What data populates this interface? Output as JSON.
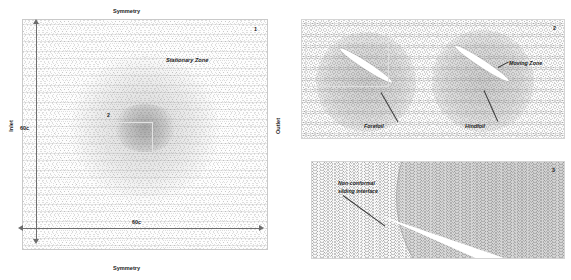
{
  "figure": {
    "type": "cfd-mesh-domain-figure",
    "colors": {
      "mesh_light": "#fdfdfd",
      "mesh_mid": "#c9c9c9",
      "axis": "#6d6d6d",
      "leader": "#3a3a3a",
      "foil": "#ffffff",
      "text": "#1b1b1b",
      "panel_border": "#d4d4d4"
    }
  },
  "panel1": {
    "number": "1",
    "zone_label": "Stationary Zone",
    "boundary_top": "Symmetry",
    "boundary_bottom": "Symmetry",
    "boundary_left": "Inlet",
    "boundary_right": "Outlet",
    "dim_vertical": "60c",
    "dim_horizontal": "60c",
    "inset_marker": "2"
  },
  "panel2": {
    "number": "2",
    "zone_label": "Moving Zone",
    "foil_front": "Forefoil",
    "foil_rear": "Hindfoil",
    "inset_marker": "3"
  },
  "panel3": {
    "number": "3",
    "interface_label_line1": "Non-conformal",
    "interface_label_line2": "sliding interface"
  }
}
